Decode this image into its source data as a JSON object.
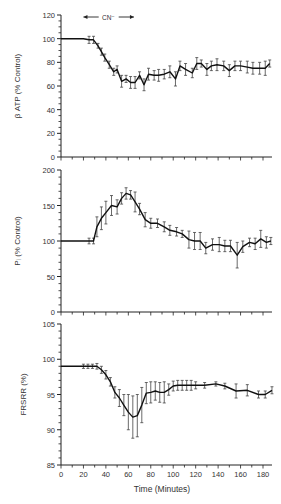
{
  "figure": {
    "xlabel": "Time (Minutes)",
    "x_ticks": [
      0,
      20,
      40,
      60,
      80,
      100,
      120,
      140,
      160,
      180
    ],
    "x_range": [
      0,
      188
    ],
    "annotation": {
      "label": "CN⁻",
      "x_start": 20,
      "x_end": 65
    }
  },
  "chart_data": [
    {
      "type": "line",
      "title": "",
      "xlabel": "Time (Minutes)",
      "ylabel": "β ATP (% Control)",
      "ylim": [
        0,
        120
      ],
      "y_ticks": [
        0,
        20,
        40,
        60,
        80,
        100,
        120
      ],
      "x": [
        0,
        20,
        25,
        29,
        33,
        36,
        39,
        43,
        47,
        50,
        54,
        58,
        62,
        66,
        70,
        74,
        78,
        83,
        87,
        92,
        97,
        102,
        106,
        111,
        117,
        121,
        125,
        130,
        134,
        139,
        145,
        150,
        155,
        160,
        166,
        171,
        177,
        182,
        186
      ],
      "values": [
        100,
        100,
        99,
        99,
        94,
        89,
        84,
        78,
        72,
        74,
        64,
        66,
        63,
        63,
        69,
        61,
        70,
        69,
        69,
        70,
        72,
        66,
        77,
        74,
        71,
        79,
        79,
        74,
        77,
        78,
        77,
        73,
        77,
        77,
        76,
        75,
        75,
        75,
        79
      ],
      "errors": [
        0,
        0,
        3,
        3,
        2,
        3,
        3,
        3,
        3,
        3,
        5,
        3,
        5,
        5,
        3,
        5,
        5,
        4,
        5,
        4,
        5,
        6,
        4,
        5,
        4,
        5,
        3,
        5,
        4,
        5,
        4,
        5,
        4,
        4,
        5,
        5,
        5,
        6,
        3
      ]
    },
    {
      "type": "line",
      "title": "",
      "xlabel": "Time (Minutes)",
      "ylabel": "Pᵢ (% Control)",
      "ylim": [
        0,
        200
      ],
      "y_ticks": [
        0,
        50,
        100,
        150,
        200
      ],
      "x": [
        0,
        20,
        25,
        29,
        32,
        36,
        40,
        45,
        50,
        54,
        58,
        62,
        66,
        70,
        75,
        80,
        86,
        92,
        97,
        103,
        108,
        114,
        119,
        124,
        129,
        135,
        141,
        146,
        151,
        157,
        162,
        168,
        173,
        178,
        183,
        187
      ],
      "values": [
        100,
        100,
        100,
        100,
        120,
        132,
        140,
        150,
        148,
        160,
        167,
        165,
        155,
        145,
        130,
        125,
        125,
        120,
        115,
        113,
        110,
        102,
        100,
        100,
        90,
        95,
        95,
        93,
        93,
        80,
        92,
        98,
        96,
        103,
        98,
        100
      ],
      "errors": [
        0,
        0,
        4,
        4,
        14,
        16,
        16,
        14,
        10,
        8,
        8,
        6,
        14,
        8,
        10,
        7,
        6,
        7,
        7,
        6,
        5,
        12,
        12,
        12,
        8,
        8,
        10,
        8,
        8,
        18,
        8,
        6,
        8,
        12,
        8,
        5
      ]
    },
    {
      "type": "line",
      "title": "",
      "xlabel": "Time (Minutes)",
      "ylabel": "FRSRR (%)",
      "ylim": [
        85,
        105
      ],
      "y_ticks": [
        85,
        90,
        95,
        100,
        105
      ],
      "x": [
        0,
        20,
        24,
        28,
        32,
        36,
        40,
        44,
        48,
        52,
        56,
        60,
        64,
        68,
        72,
        76,
        80,
        84,
        88,
        92,
        96,
        100,
        104,
        108,
        112,
        116,
        120,
        128,
        138,
        146,
        156,
        166,
        176,
        182,
        188
      ],
      "values": [
        99,
        99,
        99,
        99,
        99,
        98.5,
        97.8,
        96.8,
        95.3,
        94.5,
        93.5,
        92.5,
        91.8,
        92,
        93.5,
        95.2,
        95.3,
        95.5,
        95.3,
        95.3,
        95.7,
        96.2,
        96.3,
        96.3,
        96.3,
        96.3,
        96.3,
        96.3,
        96.5,
        96.2,
        95.5,
        95.6,
        95,
        95,
        95.6
      ],
      "errors": [
        0,
        0.3,
        0.3,
        0.3,
        0.4,
        0.5,
        0.6,
        0.6,
        0.8,
        1.2,
        1.5,
        2.5,
        3,
        3,
        2.5,
        1.5,
        1.5,
        1.3,
        1.4,
        1.5,
        0.8,
        0.7,
        0.7,
        0.7,
        0.7,
        0.7,
        0.5,
        0.4,
        0.3,
        0.4,
        1,
        0.8,
        0.5,
        0.5,
        0.5
      ]
    }
  ]
}
